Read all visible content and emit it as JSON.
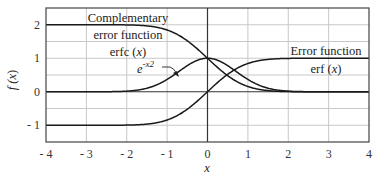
{
  "chart_data": {
    "type": "line",
    "title": "",
    "xlabel": "x",
    "ylabel": "f (x)",
    "xlim": [
      -4,
      4
    ],
    "ylim": [
      -1.5,
      2.5
    ],
    "grid": true,
    "x_ticks": [
      "- 4",
      "- 3",
      "- 2",
      "- 1",
      "0",
      "1",
      "2",
      "3",
      "4"
    ],
    "y_ticks": [
      "- 1",
      "0",
      "1",
      "2"
    ],
    "series": [
      {
        "name": "erfc (x)",
        "function": "erfc",
        "x": [
          -4,
          -3,
          -2,
          -1.5,
          -1,
          -0.5,
          0,
          0.5,
          1,
          1.5,
          2,
          3,
          4
        ],
        "values": [
          2.0,
          2.0,
          1.995,
          1.966,
          1.843,
          1.52,
          1.0,
          0.48,
          0.157,
          0.034,
          0.005,
          0.0,
          0.0
        ]
      },
      {
        "name": "erf (x)",
        "function": "erf",
        "x": [
          -4,
          -3,
          -2,
          -1.5,
          -1,
          -0.5,
          0,
          0.5,
          1,
          1.5,
          2,
          3,
          4
        ],
        "values": [
          -1.0,
          -1.0,
          -0.995,
          -0.966,
          -0.843,
          -0.52,
          0.0,
          0.52,
          0.843,
          0.966,
          0.995,
          1.0,
          1.0
        ]
      },
      {
        "name": "e^-x^2",
        "function": "gauss",
        "x": [
          -4,
          -3,
          -2,
          -1.5,
          -1,
          -0.5,
          0,
          0.5,
          1,
          1.5,
          2,
          3,
          4
        ],
        "values": [
          0.0,
          0.0,
          0.018,
          0.105,
          0.368,
          0.779,
          1.0,
          0.779,
          0.368,
          0.105,
          0.018,
          0.0,
          0.0
        ]
      }
    ],
    "annotations": [
      {
        "text_lines": [
          "Complementary",
          "error function",
          "erfc (x)"
        ],
        "target": "erfc (x)"
      },
      {
        "text_lines": [
          "Error function",
          "erf (x)"
        ],
        "target": "erf (x)"
      },
      {
        "text": "e -x2",
        "target": "e^-x^2",
        "arrow": true
      }
    ]
  },
  "labels": {
    "erfc_line1": "Complementary",
    "erfc_line2": "error function",
    "erfc_line3_name": "erfc (",
    "erfc_line3_var": "x",
    "erfc_line3_close": ")",
    "erf_line1": "Error function",
    "erf_line2_name": "erf (",
    "erf_line2_var": "x",
    "erf_line2_close": ")",
    "gauss_base": "e",
    "gauss_exp": "-x2",
    "ylabel_f": "f (",
    "ylabel_x": "x",
    "ylabel_close": ")",
    "xlabel": "x"
  },
  "colors": {
    "curve": "#1a1a1a",
    "grid": "#c8c8c8",
    "axis": "#333333",
    "frame": "#444444"
  }
}
